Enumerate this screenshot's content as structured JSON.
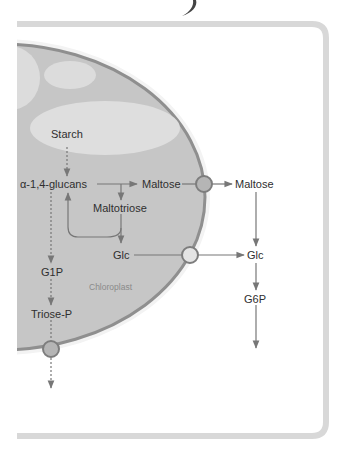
{
  "diagram": {
    "compartment_label": "Chloroplast",
    "nodes": {
      "starch": "Starch",
      "glucans": "α-1,4-glucans",
      "maltose_in": "Maltose",
      "maltose_out": "Maltose",
      "maltotriose": "Maltotriose",
      "glc_in": "Glc",
      "glc_out": "Glc",
      "g1p": "G1P",
      "triose_p": "Triose-P",
      "g6p": "G6P"
    },
    "edges": [
      {
        "from": "Starch",
        "to": "α-1,4-glucans",
        "style": "dashed"
      },
      {
        "from": "α-1,4-glucans",
        "to": "Maltose",
        "style": "solid"
      },
      {
        "from": "α-1,4-glucans",
        "to": "Maltotriose",
        "style": "solid"
      },
      {
        "from": "Maltotriose",
        "to": "α-1,4-glucans",
        "style": "solid"
      },
      {
        "from": "Maltotriose",
        "to": "Glc",
        "style": "solid"
      },
      {
        "from": "Maltose",
        "to": "Maltose (cytosol)",
        "style": "solid",
        "via": "transporter"
      },
      {
        "from": "Glc",
        "to": "Glc (cytosol)",
        "style": "solid",
        "via": "transporter"
      },
      {
        "from": "Maltose (cytosol)",
        "to": "Glc (cytosol)",
        "style": "solid"
      },
      {
        "from": "Glc (cytosol)",
        "to": "G6P",
        "style": "solid"
      },
      {
        "from": "G6P",
        "to": "downstream",
        "style": "solid"
      },
      {
        "from": "α-1,4-glucans",
        "to": "G1P",
        "style": "dashed"
      },
      {
        "from": "G1P",
        "to": "Triose-P",
        "style": "dashed"
      },
      {
        "from": "Triose-P",
        "to": "cytosol",
        "style": "dashed",
        "via": "transporter"
      }
    ],
    "colors": {
      "stroma": "#c4c4c4",
      "membrane": "#8d8d8d",
      "starch_grain": "#dedede",
      "transporter": "#b5b5b5",
      "transporter_glc": "#e4e4e4",
      "arrow": "#777777",
      "frame": "#d5d5d5"
    }
  }
}
